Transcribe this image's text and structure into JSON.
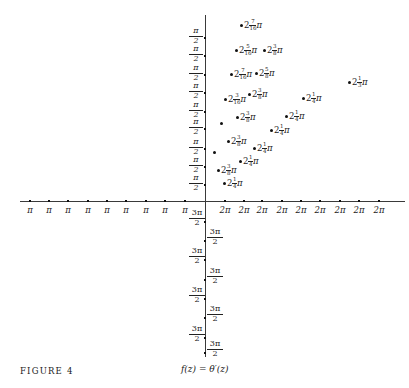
{
  "figure": {
    "label": "FIGURE 4",
    "caption": "f(z) = θ′(z)",
    "axes": {
      "origin": [
        205,
        201
      ],
      "x_range_px": [
        20,
        405
      ],
      "y_range_px": [
        15,
        355
      ]
    },
    "negative_x_ticks": [
      {
        "x": 30,
        "label": "π"
      },
      {
        "x": 49,
        "label": "π"
      },
      {
        "x": 68,
        "label": "π"
      },
      {
        "x": 88,
        "label": "π"
      },
      {
        "x": 107,
        "label": "π"
      },
      {
        "x": 126,
        "label": "π"
      },
      {
        "x": 146,
        "label": "π"
      },
      {
        "x": 165,
        "label": "π"
      },
      {
        "x": 185,
        "label": "π"
      }
    ],
    "positive_x_ticks": [
      {
        "x": 225,
        "label": "2π"
      },
      {
        "x": 244,
        "label": "2π"
      },
      {
        "x": 262,
        "label": "2π"
      },
      {
        "x": 282,
        "label": "2π"
      },
      {
        "x": 301,
        "label": "2π"
      },
      {
        "x": 320,
        "label": "2π"
      },
      {
        "x": 340,
        "label": "2π"
      },
      {
        "x": 359,
        "label": "2π"
      },
      {
        "x": 379,
        "label": "2π"
      }
    ],
    "positive_y_ticks": [
      {
        "y": 37,
        "num": "π",
        "den": "2"
      },
      {
        "y": 55,
        "num": "π",
        "den": "2"
      },
      {
        "y": 74,
        "num": "π",
        "den": "2"
      },
      {
        "y": 92,
        "num": "π",
        "den": "2"
      },
      {
        "y": 111,
        "num": "π",
        "den": "2"
      },
      {
        "y": 128,
        "num": "π",
        "den": "2"
      },
      {
        "y": 148,
        "num": "π",
        "den": "2"
      },
      {
        "y": 166,
        "num": "π",
        "den": "2"
      },
      {
        "y": 184,
        "num": "π",
        "den": "2"
      }
    ],
    "negative_y_ticks": [
      {
        "y": 221,
        "num": "3π",
        "den": "2",
        "side": "left"
      },
      {
        "y": 240,
        "num": "3π",
        "den": "2",
        "side": "right"
      },
      {
        "y": 259,
        "num": "3π",
        "den": "2",
        "side": "left"
      },
      {
        "y": 279,
        "num": "3π",
        "den": "2",
        "side": "right"
      },
      {
        "y": 298,
        "num": "3π",
        "den": "2",
        "side": "left"
      },
      {
        "y": 317,
        "num": "3π",
        "den": "2",
        "side": "right"
      },
      {
        "y": 337,
        "num": "3π",
        "den": "2",
        "side": "left"
      },
      {
        "y": 352,
        "num": "3π",
        "den": "2",
        "side": "right"
      }
    ],
    "points": [
      {
        "x": 241,
        "y": 25,
        "whole": "2",
        "num": "7",
        "den": "16",
        "suffix": "π"
      },
      {
        "x": 236,
        "y": 50,
        "whole": "2",
        "num": "5",
        "den": "16",
        "suffix": "π"
      },
      {
        "x": 264,
        "y": 50,
        "whole": "2",
        "num": "3",
        "den": "8",
        "suffix": "π"
      },
      {
        "x": 231,
        "y": 74,
        "whole": "2",
        "num": "7",
        "den": "16",
        "suffix": "π"
      },
      {
        "x": 256,
        "y": 73,
        "whole": "2",
        "num": "5",
        "den": "8",
        "suffix": "π"
      },
      {
        "x": 349,
        "y": 82,
        "whole": "2",
        "num": "1",
        "den": "3",
        "suffix": "π"
      },
      {
        "x": 225,
        "y": 99,
        "whole": "2",
        "num": "3",
        "den": "16",
        "suffix": "π"
      },
      {
        "x": 249,
        "y": 94,
        "whole": "2",
        "num": "3",
        "den": "8",
        "suffix": "π"
      },
      {
        "x": 303,
        "y": 98,
        "whole": "2",
        "num": "1",
        "den": "4",
        "suffix": "π"
      },
      {
        "x": 237,
        "y": 117,
        "whole": "2",
        "num": "3",
        "den": "8",
        "suffix": "π"
      },
      {
        "x": 286,
        "y": 116,
        "whole": "2",
        "num": "1",
        "den": "4",
        "suffix": "π"
      },
      {
        "x": 221,
        "y": 123,
        "whole": "",
        "num": "",
        "den": "",
        "suffix": ""
      },
      {
        "x": 271,
        "y": 130,
        "whole": "2",
        "num": "1",
        "den": "4",
        "suffix": "π"
      },
      {
        "x": 228,
        "y": 141,
        "whole": "2",
        "num": "3",
        "den": "8",
        "suffix": "π"
      },
      {
        "x": 254,
        "y": 148,
        "whole": "2",
        "num": "1",
        "den": "4",
        "suffix": "π"
      },
      {
        "x": 214,
        "y": 152,
        "whole": "",
        "num": "",
        "den": "",
        "suffix": ""
      },
      {
        "x": 240,
        "y": 161,
        "whole": "2",
        "num": "1",
        "den": "4",
        "suffix": "π"
      },
      {
        "x": 218,
        "y": 170,
        "whole": "2",
        "num": "3",
        "den": "8",
        "suffix": "π"
      },
      {
        "x": 224,
        "y": 183,
        "whole": "2",
        "num": "1",
        "den": "4",
        "suffix": "π"
      }
    ]
  }
}
